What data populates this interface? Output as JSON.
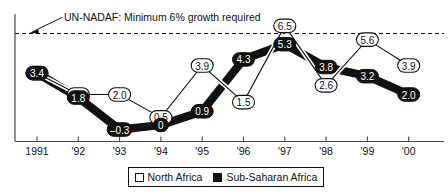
{
  "chart_data": {
    "type": "line",
    "title": "",
    "subtitle": "",
    "xlabel": "",
    "ylabel": "",
    "grid": false,
    "legend_position": "bottom",
    "categories": [
      "1991",
      "'92",
      "'93",
      "'94",
      "'95",
      "'96",
      "'97",
      "'98",
      "'99",
      "'00"
    ],
    "x_tick_labels": [
      "1991",
      "'92",
      "'93",
      "'94",
      "'95",
      "'96",
      "'97",
      "'98",
      "'99",
      "'00"
    ],
    "ylim": [
      -1.0,
      7.0
    ],
    "y_axis_visible": true,
    "y_tick_labels": [],
    "series": [
      {
        "name": "North Africa",
        "style": "open-white-pill",
        "values": [
          3.4,
          2.0,
          2.0,
          0.5,
          3.9,
          1.5,
          6.5,
          2.6,
          5.6,
          3.9
        ],
        "labels": [
          "3.4",
          "2.0",
          "2.0",
          "0.5",
          "3.9",
          "1.5",
          "6.5",
          "2.6",
          "5.6",
          "3.9"
        ]
      },
      {
        "name": "Sub-Saharan Africa",
        "style": "filled-black-pill",
        "values": [
          3.4,
          1.8,
          -0.3,
          0.0,
          0.9,
          4.3,
          5.3,
          3.8,
          3.2,
          2.0
        ],
        "labels": [
          "3.4",
          "1.8",
          "–0.3",
          "0",
          "0.9",
          "4.3",
          "5.3",
          "3.8",
          "3.2",
          "2.0"
        ]
      }
    ],
    "reference_line": {
      "value": 6.0,
      "style": "dashed",
      "annotation": "UN-NADAF: Minimum 6% growth required"
    },
    "annotations": [
      {
        "text": "UN-NADAF: Minimum 6% growth required",
        "points_to": "reference-line-6-percent"
      }
    ],
    "colors": {
      "north_africa": "#ffffff",
      "sub_saharan_africa": "#111111",
      "axis": "#4a4a4a",
      "text": "#111111",
      "reference_line": "#111111",
      "background": "#ffffff"
    }
  },
  "legend": {
    "entries": [
      {
        "label": "North Africa",
        "swatch": "open-square-icon"
      },
      {
        "label": "Sub-Saharan Africa",
        "swatch": "filled-square-icon"
      }
    ]
  },
  "annotation": {
    "label": "UN-NADAF: Minimum 6% growth required"
  },
  "axis": {
    "ticks": [
      "1991",
      "'92",
      "'93",
      "'94",
      "'95",
      "'96",
      "'97",
      "'98",
      "'99",
      "'00"
    ]
  },
  "labels": {
    "north": [
      "3.4",
      "2.0",
      "2.0",
      "0.5",
      "3.9",
      "1.5",
      "6.5",
      "2.6",
      "5.6",
      "3.9"
    ],
    "sub": [
      "3.4",
      "1.8",
      "–0.3",
      "0",
      "0.9",
      "4.3",
      "5.3",
      "3.8",
      "3.2",
      "2.0"
    ]
  }
}
